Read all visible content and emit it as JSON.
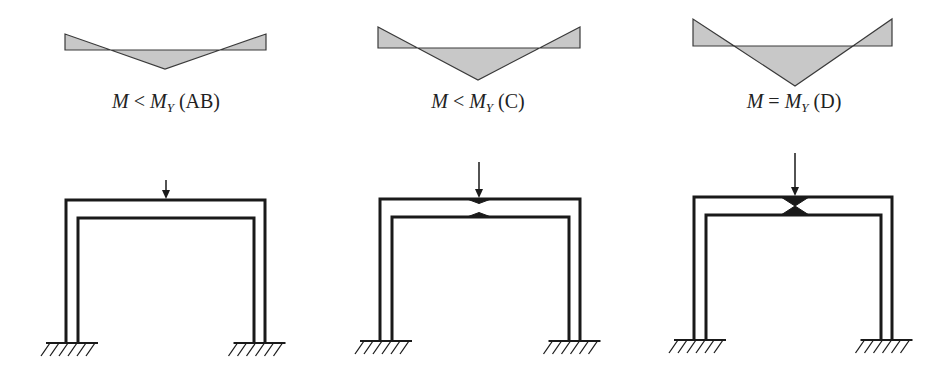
{
  "figure": {
    "colors": {
      "fill": "#c8c8c8",
      "stroke": "#3a3a3a",
      "frame": "#1a1a1a",
      "text": "#222222"
    },
    "panels": [
      {
        "id": "AB",
        "label": {
          "m": "M",
          "relation": "<",
          "my": "M",
          "sub": "Y",
          "case": "(AB)"
        },
        "moment_diagram": {
          "left": 65,
          "right": 266,
          "base_y": 50,
          "end_top_y": 34,
          "apex_x": 165,
          "apex_y": 69
        },
        "label_pos": {
          "x": 166,
          "y": 90
        },
        "frame": {
          "outer_left": 66,
          "outer_right": 265,
          "outer_top": 200,
          "inner_left": 78,
          "inner_right": 254,
          "inner_top": 218,
          "ground_y": 343,
          "arrow_x": 166,
          "arrow_top": 180,
          "yield": 0
        }
      },
      {
        "id": "C",
        "label": {
          "m": "M",
          "relation": "<",
          "my": "M",
          "sub": "Y",
          "case": "(C)"
        },
        "moment_diagram": {
          "left": 378,
          "right": 580,
          "base_y": 48,
          "end_top_y": 27,
          "apex_x": 478,
          "apex_y": 80
        },
        "label_pos": {
          "x": 478,
          "y": 90
        },
        "frame": {
          "outer_left": 380,
          "outer_right": 580,
          "outer_top": 199,
          "inner_left": 392,
          "inner_right": 569,
          "inner_top": 217,
          "ground_y": 341,
          "arrow_x": 479,
          "arrow_top": 162,
          "yield": 0.5
        }
      },
      {
        "id": "D",
        "label": {
          "m": "M",
          "relation": "=",
          "my": "M",
          "sub": "Y",
          "case": "(D)"
        },
        "moment_diagram": {
          "left": 693,
          "right": 892,
          "base_y": 46,
          "end_top_y": 19,
          "apex_x": 795,
          "apex_y": 86
        },
        "label_pos": {
          "x": 794,
          "y": 90
        },
        "frame": {
          "outer_left": 694,
          "outer_right": 892,
          "outer_top": 197,
          "inner_left": 706,
          "inner_right": 881,
          "inner_top": 215,
          "ground_y": 340,
          "arrow_x": 795,
          "arrow_top": 153,
          "yield": 1
        }
      }
    ]
  }
}
